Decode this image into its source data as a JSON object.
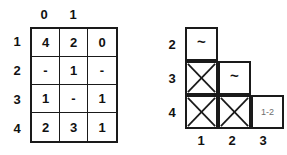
{
  "figure": {
    "background_color": "#ffffff",
    "line_color": "#1a1a1a",
    "text_color": "#111111",
    "muted_text_color": "#6e6e6e"
  },
  "left_table": {
    "name": "left-grid",
    "column_headers": [
      "0",
      "1",
      ""
    ],
    "row_headers": [
      "1",
      "2",
      "3",
      "4"
    ],
    "rows": [
      [
        "4",
        "2",
        "0"
      ],
      [
        "-",
        "1",
        "-"
      ],
      [
        "1",
        "-",
        "1"
      ],
      [
        "2",
        "3",
        "1"
      ]
    ]
  },
  "right_table": {
    "name": "right-staircase-grid",
    "row_headers": [
      "2",
      "3",
      "4"
    ],
    "column_headers": [
      "1",
      "2",
      "3"
    ],
    "cells": [
      {
        "row": "2",
        "col": "1",
        "kind": "tilde",
        "text": "~"
      },
      {
        "row": "3",
        "col": "1",
        "kind": "crossed",
        "text": ""
      },
      {
        "row": "3",
        "col": "2",
        "kind": "tilde",
        "text": "~"
      },
      {
        "row": "4",
        "col": "1",
        "kind": "crossed",
        "text": ""
      },
      {
        "row": "4",
        "col": "2",
        "kind": "crossed",
        "text": ""
      },
      {
        "row": "4",
        "col": "3",
        "kind": "range",
        "text": "1-2"
      }
    ]
  }
}
